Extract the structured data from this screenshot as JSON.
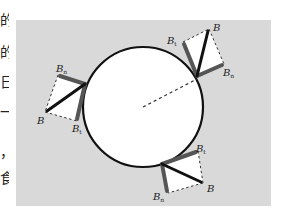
{
  "figure": {
    "type": "magnetic field decomposition at circular boundary",
    "background_color": "#d9d9d9",
    "circle": {
      "cx": 143,
      "cy": 107,
      "r": 60,
      "fill": "#ffffff",
      "stroke": "#111111"
    },
    "radius_line": {
      "style": "dashed",
      "from": [
        143,
        107
      ],
      "to": [
        197,
        79
      ]
    },
    "labels": {
      "B": "B",
      "Bt": "t",
      "Bn": "n"
    },
    "vectors": [
      {
        "position": "left",
        "origin": [
          85,
          84
        ],
        "B": [
          45,
          112
        ],
        "Bt": [
          77,
          121
        ],
        "Bn": [
          58,
          75
        ]
      },
      {
        "position": "top-right",
        "origin": [
          197,
          76
        ],
        "B": [
          209,
          29
        ],
        "Bt": [
          183,
          42
        ],
        "Bn": [
          224,
          64
        ]
      },
      {
        "position": "bottom-right",
        "origin": [
          162,
          164
        ],
        "B": [
          203,
          183
        ],
        "Bt": [
          198,
          151
        ],
        "Bn": [
          168,
          193
        ]
      }
    ]
  },
  "edge_text": [
    "的",
    "的",
    "日",
    "一",
    "，",
    "食"
  ]
}
